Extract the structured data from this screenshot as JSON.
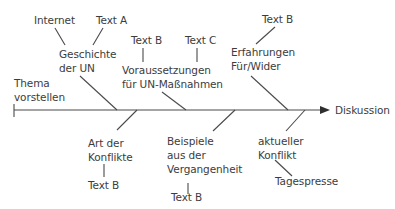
{
  "diagram": {
    "type": "fishbone",
    "start_label": [
      "Thema",
      "vorstellen"
    ],
    "end_label": "Diskussion",
    "branches": [
      {
        "side": "top",
        "label": [
          "Geschichte",
          "der UN"
        ],
        "sub": [
          "Internet",
          "Text A"
        ]
      },
      {
        "side": "top",
        "label": [
          "Voraussetzungen",
          "für UN-Maßnahmen"
        ],
        "sub": [
          "Text B",
          "Text C"
        ]
      },
      {
        "side": "top",
        "label": [
          "Erfahrungen",
          "Für/Wider"
        ],
        "sub": [
          "Text B"
        ]
      },
      {
        "side": "bottom",
        "label": [
          "Art der",
          "Konflikte"
        ],
        "sub": [
          "Text B"
        ]
      },
      {
        "side": "bottom",
        "label": [
          "Beispiele",
          "aus der",
          "Vergangenheit"
        ],
        "sub": [
          "Text B"
        ]
      },
      {
        "side": "bottom",
        "label": [
          "aktueller",
          "Konflikt"
        ],
        "sub": [
          "Tagespresse"
        ]
      }
    ]
  },
  "colors": {
    "line": "#4a4a4a",
    "text": "#3c3c3c"
  }
}
